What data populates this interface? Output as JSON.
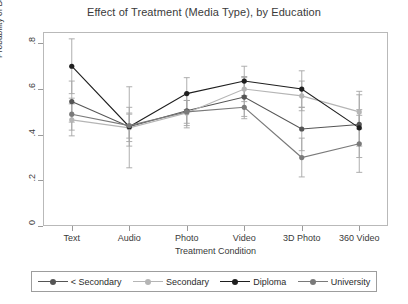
{
  "chart_data": {
    "type": "line",
    "title": "Effect of Treatment (Media Type), by Education",
    "xlabel": "Treatment Condition",
    "ylabel": "Probability of Being 'Very Interested'",
    "categories": [
      "Text",
      "Audio",
      "Photo",
      "Video",
      "3D Photo",
      "360 Video"
    ],
    "ylim": [
      0,
      0.85
    ],
    "yticks": [
      0,
      0.2,
      0.4,
      0.6,
      0.8
    ],
    "ytick_labels": [
      "0",
      ".2",
      ".4",
      ".6",
      ".8"
    ],
    "grid": false,
    "legend_position": "bottom",
    "error_bars": "95% confidence interval",
    "series": [
      {
        "name": "< Secondary",
        "color": "#555555",
        "values": [
          0.545,
          0.435,
          0.505,
          0.565,
          0.425,
          0.445
        ],
        "ci_low": [
          0.455,
          0.255,
          0.43,
          0.48,
          0.33,
          0.3
        ],
        "ci_high": [
          0.635,
          0.61,
          0.58,
          0.65,
          0.52,
          0.59
        ]
      },
      {
        "name": "Secondary",
        "color": "#b5b5b5",
        "values": [
          0.465,
          0.43,
          0.495,
          0.6,
          0.57,
          0.5
        ],
        "ci_low": [
          0.395,
          0.37,
          0.44,
          0.545,
          0.505,
          0.425
        ],
        "ci_high": [
          0.535,
          0.49,
          0.55,
          0.655,
          0.635,
          0.575
        ]
      },
      {
        "name": "Diploma",
        "color": "#1f1f1f",
        "values": [
          0.7,
          0.435,
          0.58,
          0.635,
          0.6,
          0.43
        ],
        "ci_low": [
          0.58,
          0.35,
          0.51,
          0.57,
          0.52,
          0.35
        ],
        "ci_high": [
          0.82,
          0.52,
          0.65,
          0.7,
          0.68,
          0.51
        ]
      },
      {
        "name": "University",
        "color": "#7a7a7a",
        "values": [
          0.49,
          0.44,
          0.5,
          0.52,
          0.3,
          0.36
        ],
        "ci_low": [
          0.42,
          0.385,
          0.45,
          0.47,
          0.215,
          0.235
        ],
        "ci_high": [
          0.56,
          0.495,
          0.55,
          0.57,
          0.385,
          0.485
        ]
      }
    ]
  }
}
